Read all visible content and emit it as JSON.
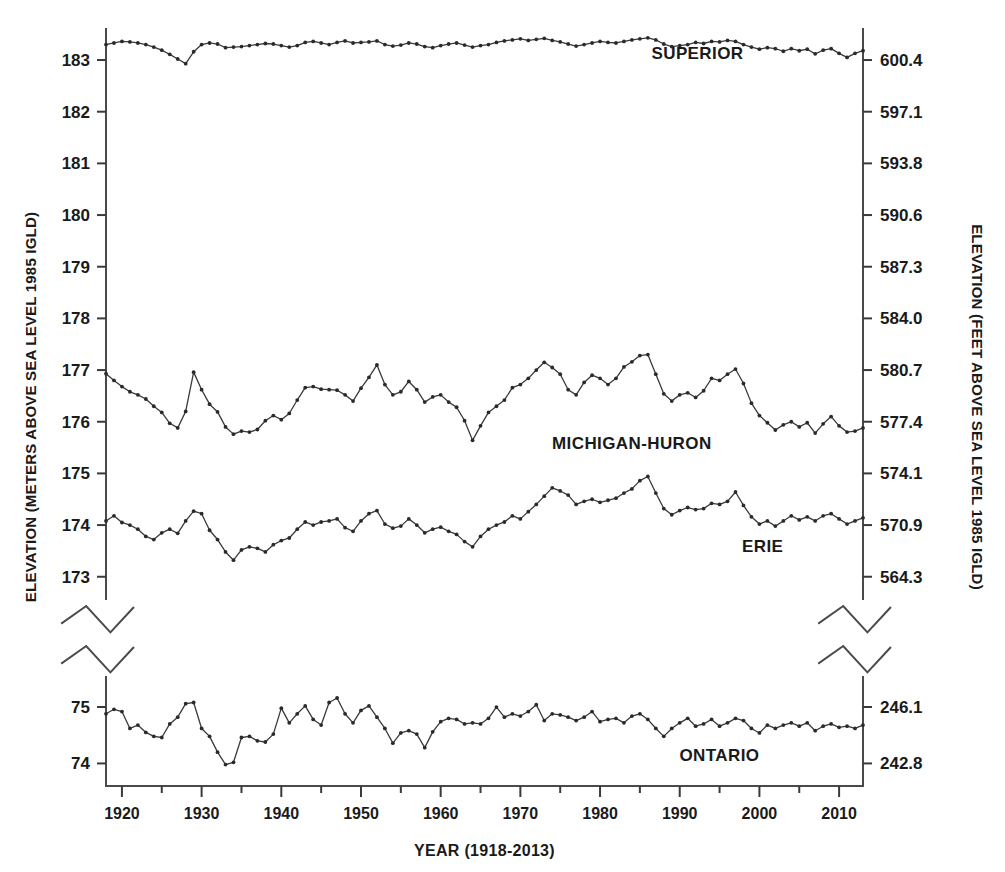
{
  "chart_data": {
    "type": "line",
    "title": "",
    "subtitle": "",
    "xlabel": "YEAR (1918-2013)",
    "ylabel_left": "ELEVATION (METERS ABOVE SEA LEVEL 1985 IGLD)",
    "ylabel_right": "ELEVATION (FEET ABOVE SEA LEVEL 1985 IGLD)",
    "grid": false,
    "legend_position": "inline-right",
    "x_range": [
      1918,
      2013
    ],
    "x_ticks": [
      1920,
      1930,
      1940,
      1950,
      1960,
      1970,
      1980,
      1990,
      2000,
      2010
    ],
    "x_tick_labels": [
      "1920",
      "1930",
      "1940",
      "1950",
      "1960",
      "1970",
      "1980",
      "1990",
      "2000",
      "2010"
    ],
    "x_minor_tick_step": 5,
    "axis_break": true,
    "upper_panel": {
      "y_ticks_left": [
        173,
        174,
        175,
        176,
        177,
        178,
        179,
        180,
        181,
        182,
        183
      ],
      "y_tick_labels_left": [
        "173",
        "174",
        "175",
        "176",
        "177",
        "178",
        "179",
        "180",
        "181",
        "182",
        "183"
      ],
      "y_ticks_right_labels": [
        "564.3",
        "570.9",
        "574.1",
        "577.4",
        "580.7",
        "584.0",
        "587.3",
        "590.6",
        "593.8",
        "597.1",
        "600.4"
      ],
      "ylim": [
        172.55,
        183.62
      ]
    },
    "lower_panel": {
      "y_ticks_left": [
        74,
        75
      ],
      "y_tick_labels_left": [
        "74",
        "75"
      ],
      "y_ticks_right_labels": [
        "242.8",
        "246.1"
      ],
      "ylim": [
        73.6,
        75.55
      ]
    },
    "series": [
      {
        "name": "SUPERIOR",
        "label": "SUPERIOR",
        "panel": "upper",
        "color": "#2a2a2a",
        "label_x": 1998,
        "label_y": 183.02,
        "x": [
          1918,
          1919,
          1920,
          1921,
          1922,
          1923,
          1924,
          1925,
          1926,
          1927,
          1928,
          1929,
          1930,
          1931,
          1932,
          1933,
          1934,
          1935,
          1936,
          1937,
          1938,
          1939,
          1940,
          1941,
          1942,
          1943,
          1944,
          1945,
          1946,
          1947,
          1948,
          1949,
          1950,
          1951,
          1952,
          1953,
          1954,
          1955,
          1956,
          1957,
          1958,
          1959,
          1960,
          1961,
          1962,
          1963,
          1964,
          1965,
          1966,
          1967,
          1968,
          1969,
          1970,
          1971,
          1972,
          1973,
          1974,
          1975,
          1976,
          1977,
          1978,
          1979,
          1980,
          1981,
          1982,
          1983,
          1984,
          1985,
          1986,
          1987,
          1988,
          1989,
          1990,
          1991,
          1992,
          1993,
          1994,
          1995,
          1996,
          1997,
          1998,
          1999,
          2000,
          2001,
          2002,
          2003,
          2004,
          2005,
          2006,
          2007,
          2008,
          2009,
          2010,
          2011,
          2012,
          2013
        ],
        "y": [
          183.3,
          183.33,
          183.36,
          183.35,
          183.33,
          183.3,
          183.25,
          183.19,
          183.11,
          183.02,
          182.93,
          183.16,
          183.3,
          183.33,
          183.31,
          183.24,
          183.25,
          183.26,
          183.28,
          183.3,
          183.32,
          183.31,
          183.28,
          183.25,
          183.28,
          183.34,
          183.36,
          183.33,
          183.3,
          183.34,
          183.37,
          183.33,
          183.34,
          183.35,
          183.37,
          183.3,
          183.27,
          183.29,
          183.33,
          183.31,
          183.26,
          183.24,
          183.28,
          183.31,
          183.33,
          183.29,
          183.25,
          183.28,
          183.3,
          183.34,
          183.37,
          183.39,
          183.41,
          183.38,
          183.4,
          183.42,
          183.38,
          183.35,
          183.31,
          183.27,
          183.3,
          183.33,
          183.36,
          183.34,
          183.33,
          183.36,
          183.39,
          183.41,
          183.43,
          183.39,
          183.31,
          183.26,
          183.28,
          183.3,
          183.34,
          183.32,
          183.36,
          183.35,
          183.38,
          183.36,
          183.3,
          183.25,
          183.21,
          183.24,
          183.22,
          183.17,
          183.22,
          183.18,
          183.21,
          183.12,
          183.19,
          183.22,
          183.13,
          183.05,
          183.13,
          183.18
        ]
      },
      {
        "name": "MICHIGAN-HURON",
        "label": "MICHIGAN-HURON",
        "panel": "upper",
        "color": "#2a2a2a",
        "label_x": 1994,
        "label_y": 175.48,
        "x": [
          1918,
          1919,
          1920,
          1921,
          1922,
          1923,
          1924,
          1925,
          1926,
          1927,
          1928,
          1929,
          1930,
          1931,
          1932,
          1933,
          1934,
          1935,
          1936,
          1937,
          1938,
          1939,
          1940,
          1941,
          1942,
          1943,
          1944,
          1945,
          1946,
          1947,
          1948,
          1949,
          1950,
          1951,
          1952,
          1953,
          1954,
          1955,
          1956,
          1957,
          1958,
          1959,
          1960,
          1961,
          1962,
          1963,
          1964,
          1965,
          1966,
          1967,
          1968,
          1969,
          1970,
          1971,
          1972,
          1973,
          1974,
          1975,
          1976,
          1977,
          1978,
          1979,
          1980,
          1981,
          1982,
          1983,
          1984,
          1985,
          1986,
          1987,
          1988,
          1989,
          1990,
          1991,
          1992,
          1993,
          1994,
          1995,
          1996,
          1997,
          1998,
          1999,
          2000,
          2001,
          2002,
          2003,
          2004,
          2005,
          2006,
          2007,
          2008,
          2009,
          2010,
          2011,
          2012,
          2013
        ],
        "y": [
          176.93,
          176.8,
          176.68,
          176.58,
          176.52,
          176.44,
          176.3,
          176.18,
          175.97,
          175.88,
          176.2,
          176.96,
          176.62,
          176.34,
          176.19,
          175.9,
          175.76,
          175.82,
          175.8,
          175.85,
          176.02,
          176.12,
          176.04,
          176.16,
          176.42,
          176.66,
          176.68,
          176.63,
          176.62,
          176.61,
          176.52,
          176.4,
          176.65,
          176.86,
          177.1,
          176.72,
          176.52,
          176.58,
          176.78,
          176.62,
          176.38,
          176.48,
          176.52,
          176.38,
          176.28,
          176.02,
          175.64,
          175.92,
          176.18,
          176.3,
          176.42,
          176.66,
          176.72,
          176.84,
          177.0,
          177.15,
          177.05,
          176.92,
          176.62,
          176.52,
          176.76,
          176.9,
          176.84,
          176.72,
          176.84,
          177.06,
          177.16,
          177.28,
          177.3,
          176.92,
          176.54,
          176.4,
          176.52,
          176.56,
          176.47,
          176.6,
          176.84,
          176.8,
          176.92,
          177.02,
          176.74,
          176.36,
          176.12,
          175.98,
          175.84,
          175.94,
          176.0,
          175.9,
          175.98,
          175.78,
          175.96,
          176.1,
          175.92,
          175.8,
          175.82,
          175.88
        ]
      },
      {
        "name": "ERIE",
        "label": "ERIE",
        "panel": "upper",
        "color": "#2a2a2a",
        "label_x": 2003,
        "label_y": 173.48,
        "x": [
          1918,
          1919,
          1920,
          1921,
          1922,
          1923,
          1924,
          1925,
          1926,
          1927,
          1928,
          1929,
          1930,
          1931,
          1932,
          1933,
          1934,
          1935,
          1936,
          1937,
          1938,
          1939,
          1940,
          1941,
          1942,
          1943,
          1944,
          1945,
          1946,
          1947,
          1948,
          1949,
          1950,
          1951,
          1952,
          1953,
          1954,
          1955,
          1956,
          1957,
          1958,
          1959,
          1960,
          1961,
          1962,
          1963,
          1964,
          1965,
          1966,
          1967,
          1968,
          1969,
          1970,
          1971,
          1972,
          1973,
          1974,
          1975,
          1976,
          1977,
          1978,
          1979,
          1980,
          1981,
          1982,
          1983,
          1984,
          1985,
          1986,
          1987,
          1988,
          1989,
          1990,
          1991,
          1992,
          1993,
          1994,
          1995,
          1996,
          1997,
          1998,
          1999,
          2000,
          2001,
          2002,
          2003,
          2004,
          2005,
          2006,
          2007,
          2008,
          2009,
          2010,
          2011,
          2012,
          2013
        ],
        "y": [
          174.08,
          174.18,
          174.05,
          174.0,
          173.92,
          173.78,
          173.72,
          173.85,
          173.92,
          173.84,
          174.08,
          174.27,
          174.22,
          173.9,
          173.72,
          173.48,
          173.32,
          173.52,
          173.58,
          173.55,
          173.48,
          173.62,
          173.7,
          173.75,
          173.92,
          174.06,
          174.0,
          174.06,
          174.08,
          174.12,
          173.95,
          173.88,
          174.08,
          174.22,
          174.28,
          174.02,
          173.94,
          173.98,
          174.12,
          174.0,
          173.85,
          173.92,
          173.96,
          173.88,
          173.82,
          173.68,
          173.58,
          173.78,
          173.92,
          174.0,
          174.06,
          174.18,
          174.12,
          174.26,
          174.4,
          174.56,
          174.72,
          174.66,
          174.58,
          174.4,
          174.46,
          174.5,
          174.44,
          174.48,
          174.52,
          174.62,
          174.7,
          174.86,
          174.94,
          174.62,
          174.32,
          174.2,
          174.28,
          174.34,
          174.3,
          174.32,
          174.42,
          174.4,
          174.46,
          174.64,
          174.38,
          174.16,
          174.02,
          174.08,
          173.98,
          174.08,
          174.18,
          174.1,
          174.16,
          174.08,
          174.18,
          174.22,
          174.12,
          174.02,
          174.08,
          174.14
        ]
      },
      {
        "name": "ONTARIO",
        "label": "ONTARIO",
        "panel": "lower",
        "color": "#2a2a2a",
        "label_x": 2000,
        "label_y": 74.05,
        "x": [
          1918,
          1919,
          1920,
          1921,
          1922,
          1923,
          1924,
          1925,
          1926,
          1927,
          1928,
          1929,
          1930,
          1931,
          1932,
          1933,
          1934,
          1935,
          1936,
          1937,
          1938,
          1939,
          1940,
          1941,
          1942,
          1943,
          1944,
          1945,
          1946,
          1947,
          1948,
          1949,
          1950,
          1951,
          1952,
          1953,
          1954,
          1955,
          1956,
          1957,
          1958,
          1959,
          1960,
          1961,
          1962,
          1963,
          1964,
          1965,
          1966,
          1967,
          1968,
          1969,
          1970,
          1971,
          1972,
          1973,
          1974,
          1975,
          1976,
          1977,
          1978,
          1979,
          1980,
          1981,
          1982,
          1983,
          1984,
          1985,
          1986,
          1987,
          1988,
          1989,
          1990,
          1991,
          1992,
          1993,
          1994,
          1995,
          1996,
          1997,
          1998,
          1999,
          2000,
          2001,
          2002,
          2003,
          2004,
          2005,
          2006,
          2007,
          2008,
          2009,
          2010,
          2011,
          2012,
          2013
        ],
        "y": [
          74.88,
          74.96,
          74.92,
          74.62,
          74.68,
          74.55,
          74.48,
          74.46,
          74.7,
          74.82,
          75.06,
          75.08,
          74.62,
          74.48,
          74.2,
          73.98,
          74.02,
          74.46,
          74.48,
          74.4,
          74.38,
          74.52,
          74.98,
          74.72,
          74.88,
          75.02,
          74.78,
          74.68,
          75.08,
          75.16,
          74.88,
          74.72,
          74.94,
          75.02,
          74.82,
          74.62,
          74.36,
          74.54,
          74.58,
          74.52,
          74.28,
          74.56,
          74.74,
          74.8,
          74.78,
          74.7,
          74.72,
          74.7,
          74.8,
          75.0,
          74.82,
          74.88,
          74.84,
          74.92,
          75.04,
          74.76,
          74.88,
          74.86,
          74.82,
          74.76,
          74.82,
          74.92,
          74.74,
          74.78,
          74.8,
          74.72,
          74.84,
          74.88,
          74.78,
          74.62,
          74.48,
          74.62,
          74.72,
          74.8,
          74.66,
          74.7,
          74.78,
          74.66,
          74.72,
          74.8,
          74.76,
          74.62,
          74.54,
          74.68,
          74.62,
          74.68,
          74.72,
          74.66,
          74.72,
          74.58,
          74.66,
          74.7,
          74.64,
          74.66,
          74.62,
          74.68
        ]
      }
    ]
  }
}
